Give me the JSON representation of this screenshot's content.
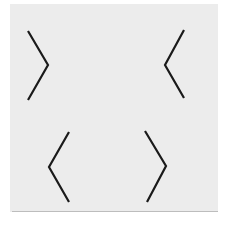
{
  "figure": {
    "background_color": "#ececec",
    "stroke_color": "#1a1a1a",
    "stroke_width": 2.2,
    "shapes": [
      {
        "name": "top-left-chevron-right",
        "direction": "right",
        "points": "28,31 48,65 28,100"
      },
      {
        "name": "top-right-chevron-left",
        "direction": "left",
        "points": "184,30 165,65 184,98"
      },
      {
        "name": "bottom-left-chevron-left",
        "direction": "left",
        "points": "69,132 49,167 69,202"
      },
      {
        "name": "bottom-right-chevron-right",
        "direction": "right",
        "points": "145,131 166,166 147,202"
      }
    ]
  }
}
